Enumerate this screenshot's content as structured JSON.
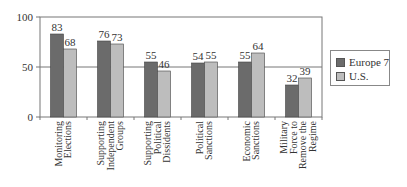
{
  "chart_data": {
    "type": "bar",
    "title": "",
    "xlabel": "",
    "ylabel": "",
    "ylim": [
      0,
      100
    ],
    "yticks": [
      0,
      50,
      100
    ],
    "grid": "horizontal line at 50",
    "legend_position": "right",
    "categories": [
      [
        "Monitoring",
        "Elections"
      ],
      [
        "Supporting",
        "Independent",
        "Groups"
      ],
      [
        "Supporting",
        "Political",
        "Dissidents"
      ],
      [
        "Political",
        "Sanctions"
      ],
      [
        "Economic",
        "Sanctions"
      ],
      [
        "Military",
        "Force to",
        "Remove the",
        "Regime"
      ]
    ],
    "series": [
      {
        "name": "Europe 7",
        "color": "#6b6b6b",
        "values": [
          83,
          76,
          55,
          54,
          55,
          32
        ]
      },
      {
        "name": "U.S.",
        "color": "#bdbdbd",
        "values": [
          68,
          73,
          46,
          55,
          64,
          39
        ]
      }
    ]
  },
  "legend": {
    "items": [
      "Europe 7",
      "U.S."
    ]
  }
}
